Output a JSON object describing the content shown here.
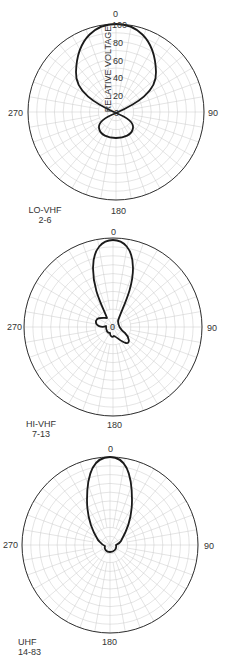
{
  "chart_data": [
    {
      "type": "polar",
      "title": "LO-VHF 2-6",
      "band": "LO-VHF",
      "channels": "2-6",
      "radial_label": "RELATIVE VOLTAGE",
      "radial_ticks": [
        0,
        20,
        40,
        60,
        80,
        100
      ],
      "angle_labels": [
        "0",
        "90",
        "180",
        "270"
      ],
      "center": [
        116,
        112
      ],
      "radius": 88,
      "pattern_path": "M116,24 C98,24 77,36 76,72 C75,92 96,104 116,113 C136,104 157,92 156,72 C155,36 134,24 116,24 Z M116,113 C106,117 98,122 99,128 C100,135 108,138 116,138 C124,138 132,135 133,128 C134,122 126,117 116,113 Z"
    },
    {
      "type": "polar",
      "title": "HI-VHF 7-13",
      "band": "HI-VHF",
      "channels": "7-13",
      "angle_labels": [
        "0",
        "90",
        "180",
        "270"
      ],
      "center": [
        113,
        327
      ],
      "radius": 89,
      "pattern_path": "M113,240 C103,240 93,248 93,268 C93,290 102,305 107,318 C102,318 97,317 96,321 C95,326 102,328 106,326 C106,331 107,333 110,333 C110,336 112,338 114,336 C117,337 121,342 126,343 C130,344 130,338 125,333 C121,330 118,327 118,321 C122,308 133,290 133,268 C133,248 123,240 113,240 Z"
    },
    {
      "type": "polar",
      "title": "UHF 14-83",
      "band": "UHF",
      "channels": "14-83",
      "angle_labels": [
        "0",
        "90",
        "180",
        "270"
      ],
      "center": [
        110,
        545
      ],
      "radius": 88,
      "pattern_path": "M110,457 C96,457 87,470 87,500 C87,520 93,532 98,540 C101,543 102,545 105,546 C104,549 106,552 110,552 C114,552 117,549 116,545 C118,544 120,543 121,541 C126,532 132,520 132,500 C132,470 124,457 110,457 Z"
    }
  ]
}
